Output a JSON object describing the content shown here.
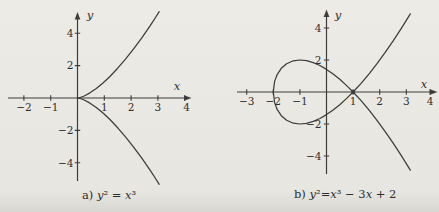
{
  "page": {
    "background_top": "#edebe6",
    "background_mid": "#e8e6e0",
    "background_bottom": "#d9d7d1",
    "ink_color": "#2e2e2e",
    "line_color": "#3c3c3c"
  },
  "figure": {
    "plots": [
      {
        "key": "a",
        "axis_letter_x": "x",
        "axis_letter_y": "y",
        "x_tick_labels": [
          "−2",
          "−1",
          "1",
          "2",
          "3",
          "4"
        ],
        "y_tick_labels": [
          "4",
          "2",
          "−2",
          "−4"
        ]
      },
      {
        "key": "b",
        "axis_letter_x": "x",
        "axis_letter_y": "y",
        "x_tick_labels": [
          "−3",
          "−2",
          "−1",
          "1",
          "2",
          "3",
          "4"
        ],
        "y_tick_labels": [
          "4",
          "2",
          "−2",
          "−4"
        ]
      }
    ],
    "captions": {
      "a": [
        "a) ",
        "y",
        "²",
        " = ",
        "x",
        "³"
      ],
      "b": [
        "b) ",
        "y",
        "²",
        "=",
        "x",
        "³",
        " − 3",
        "x",
        " + 2"
      ]
    }
  },
  "chart_data": [
    {
      "type": "line",
      "title": "a) y² = x³",
      "equation": "y² = x³",
      "xlabel": "x",
      "ylabel": "y",
      "x_ticks": [
        -2,
        -1,
        1,
        2,
        3,
        4
      ],
      "y_ticks": [
        -4,
        -2,
        2,
        4
      ],
      "xlim": [
        -2.6,
        4.2
      ],
      "ylim": [
        -5.4,
        5.4
      ],
      "grid": false,
      "legend": "none",
      "series": [
        {
          "name": "upper branch y = x^(3/2)",
          "points": [
            [
              0,
              0
            ],
            [
              0.1,
              0.032
            ],
            [
              0.25,
              0.125
            ],
            [
              0.45,
              0.302
            ],
            [
              0.7,
              0.586
            ],
            [
              0.95,
              0.926
            ],
            [
              1.2,
              1.315
            ],
            [
              1.5,
              1.837
            ],
            [
              1.8,
              2.415
            ],
            [
              2.1,
              3.043
            ],
            [
              2.4,
              3.718
            ],
            [
              2.7,
              4.437
            ],
            [
              2.9,
              4.938
            ],
            [
              3.05,
              5.327
            ]
          ]
        },
        {
          "name": "lower branch y = −x^(3/2)",
          "points": [
            [
              0,
              0
            ],
            [
              0.1,
              -0.032
            ],
            [
              0.25,
              -0.125
            ],
            [
              0.45,
              -0.302
            ],
            [
              0.7,
              -0.586
            ],
            [
              0.95,
              -0.926
            ],
            [
              1.2,
              -1.315
            ],
            [
              1.5,
              -1.837
            ],
            [
              1.8,
              -2.415
            ],
            [
              2.1,
              -3.043
            ],
            [
              2.4,
              -3.718
            ],
            [
              2.7,
              -4.437
            ],
            [
              2.9,
              -4.938
            ],
            [
              3.05,
              -5.327
            ]
          ]
        }
      ]
    },
    {
      "type": "line",
      "title": "b) y² = x³ − 3x + 2",
      "equation": "y² = x³ − 3x + 2",
      "xlabel": "x",
      "ylabel": "y",
      "x_ticks": [
        -3,
        -2,
        -1,
        1,
        2,
        3,
        4
      ],
      "y_ticks": [
        -4,
        -2,
        2,
        4
      ],
      "xlim": [
        -3.4,
        4.2
      ],
      "ylim": [
        -5.2,
        5.2
      ],
      "grid": false,
      "legend": "none",
      "annotations": [
        {
          "type": "node-point",
          "point": [
            1,
            0
          ]
        }
      ],
      "series": [
        {
          "name": "branch y = (1−x)√(x+2)",
          "points": [
            [
              -2,
              0
            ],
            [
              -1.95,
              0.66
            ],
            [
              -1.85,
              1.104
            ],
            [
              -1.7,
              1.479
            ],
            [
              -1.5,
              1.768
            ],
            [
              -1.25,
              1.949
            ],
            [
              -1,
              2.0
            ],
            [
              -0.75,
              1.957
            ],
            [
              -0.5,
              1.837
            ],
            [
              -0.25,
              1.654
            ],
            [
              0,
              1.414
            ],
            [
              0.25,
              1.125
            ],
            [
              0.5,
              0.791
            ],
            [
              0.75,
              0.415
            ],
            [
              1,
              0
            ],
            [
              1.3,
              -0.545
            ],
            [
              1.6,
              -1.138
            ],
            [
              1.9,
              -1.777
            ],
            [
              2.2,
              -2.459
            ],
            [
              2.5,
              -3.182
            ],
            [
              2.8,
              -3.944
            ],
            [
              3.0,
              -4.472
            ],
            [
              3.15,
              -4.879
            ]
          ]
        },
        {
          "name": "branch y = (x−1)√(x+2)",
          "points": [
            [
              -2,
              0
            ],
            [
              -1.95,
              -0.66
            ],
            [
              -1.85,
              -1.104
            ],
            [
              -1.7,
              -1.479
            ],
            [
              -1.5,
              -1.768
            ],
            [
              -1.25,
              -1.949
            ],
            [
              -1,
              -2.0
            ],
            [
              -0.75,
              -1.957
            ],
            [
              -0.5,
              -1.837
            ],
            [
              -0.25,
              -1.654
            ],
            [
              0,
              -1.414
            ],
            [
              0.25,
              -1.125
            ],
            [
              0.5,
              -0.791
            ],
            [
              0.75,
              -0.415
            ],
            [
              1,
              0
            ],
            [
              1.3,
              0.545
            ],
            [
              1.6,
              1.138
            ],
            [
              1.9,
              1.777
            ],
            [
              2.2,
              2.459
            ],
            [
              2.5,
              3.182
            ],
            [
              2.8,
              3.944
            ],
            [
              3.0,
              4.472
            ],
            [
              3.15,
              4.879
            ]
          ]
        }
      ]
    }
  ]
}
